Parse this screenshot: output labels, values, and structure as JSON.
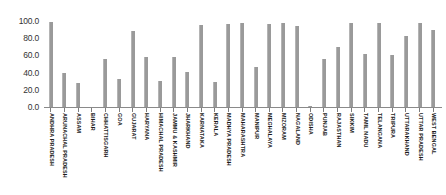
{
  "chart_data": {
    "type": "bar",
    "title": "",
    "xlabel": "",
    "ylabel": "",
    "ylim": [
      0,
      100
    ],
    "grid": false,
    "legend": "none",
    "bar_color": "#9a9a9a",
    "yticks": [
      "0.0",
      "20.0",
      "40.0",
      "60.0",
      "80.0",
      "100.0"
    ],
    "ytick_values": [
      0,
      20,
      40,
      60,
      80,
      100
    ],
    "categories": [
      "ANDHRA PRADESH",
      "ARUNACHAL PRADESH",
      "ASSAM",
      "BIHAR",
      "CHHATTISGARH",
      "GOA",
      "GUJARAT",
      "HARYANA",
      "HIMACHAL PRADESH",
      "JAMMU & KASHMIR",
      "JHARKHAND",
      "KARNATAKA",
      "KERALA",
      "MADHYA PRADESH",
      "MAHARASHTRA",
      "MANIPUR",
      "MEGHALAYA",
      "MIZORAM",
      "NAGALAND",
      "ODISHA",
      "PUNJAB",
      "RAJASTHAN",
      "SIKKIM",
      "TAMIL NADU",
      "TELANGANA",
      "TRIPURA",
      "UTTARAKHAND",
      "UTTAR PRADESH",
      "WEST BENGAL"
    ],
    "values": [
      99,
      39,
      28,
      0,
      56,
      32,
      88,
      58,
      30,
      58,
      41,
      95,
      29,
      97,
      98,
      47,
      96,
      98,
      94,
      1,
      56,
      70,
      98,
      62,
      98,
      61,
      82,
      98,
      90
    ]
  }
}
